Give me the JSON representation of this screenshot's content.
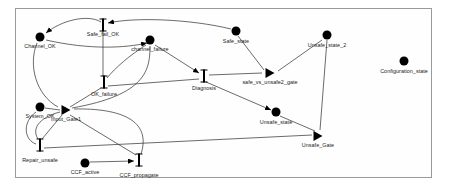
{
  "diagram": {
    "background_color": "#ffffff",
    "frame_color": "#9a9a9a",
    "ink_color": "#000000",
    "places": [
      {
        "id": "channel_ok",
        "label": "Channel_OK",
        "x": 40,
        "y": 37,
        "label_x": 40,
        "label_y": 43
      },
      {
        "id": "channel_failure",
        "label": "channel_failure",
        "x": 150,
        "y": 40,
        "label_x": 150,
        "label_y": 46
      },
      {
        "id": "safe_state",
        "label": "Safe_state",
        "x": 236,
        "y": 31,
        "label_x": 236,
        "label_y": 38
      },
      {
        "id": "unsafe_state_2",
        "label": "Unsafe_state_2",
        "x": 327,
        "y": 35,
        "label_x": 327,
        "label_y": 42
      },
      {
        "id": "configuration_state",
        "label": "Configuration_state",
        "x": 404,
        "y": 61,
        "label_x": 404,
        "label_y": 68
      },
      {
        "id": "system_ok",
        "label": "System_OK",
        "x": 40,
        "y": 107,
        "label_x": 40,
        "label_y": 113
      },
      {
        "id": "unsafe_state",
        "label": "Unsafe_state",
        "x": 276,
        "y": 112,
        "label_x": 276,
        "label_y": 119
      },
      {
        "id": "ccf_active",
        "label": "CCF_active",
        "x": 85,
        "y": 163,
        "label_x": 85,
        "label_y": 169
      }
    ],
    "activities": [
      {
        "id": "safe_fail_ok",
        "label": "Safe_fail_OK",
        "x": 103,
        "y": 25,
        "label_x": 103,
        "label_y": 31
      },
      {
        "id": "ok_failure",
        "label": "OK_failure",
        "x": 104,
        "y": 82,
        "label_x": 104,
        "label_y": 91
      },
      {
        "id": "diagnosis",
        "label": "Diagnosis",
        "x": 204,
        "y": 76,
        "label_x": 204,
        "label_y": 85
      },
      {
        "id": "repair_unsafe",
        "label": "Repair_unsafe",
        "x": 40,
        "y": 145,
        "label_x": 40,
        "label_y": 157
      },
      {
        "id": "ccf_propagate",
        "label": "CCF_propagate",
        "x": 139,
        "y": 160,
        "label_x": 139,
        "label_y": 172
      }
    ],
    "gates": [
      {
        "id": "safe_vs_unsafe2_gate",
        "label": "safe_vs_unsafe2_gate",
        "x": 270,
        "y": 73,
        "label_x": 270,
        "label_y": 79
      },
      {
        "id": "input_gate1",
        "label": "Input_Gate1",
        "x": 66,
        "y": 110,
        "label_x": 66,
        "label_y": 116
      },
      {
        "id": "unsafe_gate",
        "label": "Unsafe_Gate",
        "x": 318,
        "y": 136,
        "label_x": 318,
        "label_y": 142
      }
    ],
    "arcs": [
      {
        "from": "safe_fail_ok",
        "to": "channel_ok",
        "path": "M 101 22 C 88 14 62 20 46 33",
        "arrow": true,
        "arrow_at": "46,33",
        "arrow_angle": 140
      },
      {
        "from": "safe_state",
        "to": "safe_fail_ok",
        "path": "M 231 29 C 190 19 135 17 108 23",
        "arrow": true,
        "arrow_at": "108,23",
        "arrow_angle": 190
      },
      {
        "from": "channel_ok",
        "to": "channel_failure",
        "path": "M 46 40 C 90 50 125 48 147 43",
        "arrow": true,
        "arrow_at": "147,43",
        "arrow_angle": 345
      },
      {
        "from": "safe_fail_ok",
        "to": "ok_failure",
        "path": "M 103 32 L 103 76",
        "arrow": false
      },
      {
        "from": "channel_ok",
        "to": "input_gate1",
        "path": "M 37 43 C 28 65 36 95 58 107",
        "arrow": false
      },
      {
        "from": "channel_failure",
        "to": "diagnosis",
        "path": "M 155 45 L 199 73",
        "arrow": true,
        "arrow_at": "199,73",
        "arrow_angle": 33
      },
      {
        "from": "channel_failure",
        "to": "ok_failure",
        "path": "M 146 45 C 130 55 115 68 107 78",
        "arrow": false
      },
      {
        "from": "channel_failure",
        "to": "input_gate1",
        "path": "M 150 46 C 150 70 146 95 72 108",
        "arrow": false
      },
      {
        "from": "safe_state",
        "to": "safe_vs_unsafe2_gate",
        "path": "M 238 36 L 264 70",
        "arrow": false
      },
      {
        "from": "safe_vs_unsafe2_gate",
        "to": "unsafe_state_2",
        "path": "M 278 71 L 322 40",
        "arrow": false
      },
      {
        "from": "diagnosis",
        "to": "safe_vs_unsafe2_gate",
        "path": "M 209 75 L 262 73",
        "arrow": false
      },
      {
        "from": "ok_failure",
        "to": "diagnosis",
        "path": "M 108 86 L 199 79",
        "arrow": false
      },
      {
        "from": "ok_failure",
        "to": "input_gate1",
        "path": "M 101 88 L 70 107",
        "arrow": false
      },
      {
        "from": "diagnosis",
        "to": "unsafe_state",
        "path": "M 206 82 L 271 110",
        "arrow": true,
        "arrow_at": "271,110",
        "arrow_angle": 24
      },
      {
        "from": "unsafe_state",
        "to": "unsafe_gate",
        "path": "M 280 116 L 315 131",
        "arrow": false
      },
      {
        "from": "unsafe_state_2",
        "to": "unsafe_gate",
        "path": "M 327 40 L 320 130",
        "arrow": false
      },
      {
        "from": "system_ok",
        "to": "input_gate1",
        "path": "M 45 108 L 60 110",
        "arrow": false
      },
      {
        "from": "input_gate1",
        "to": "system_ok",
        "path": "M 36 112 C 22 122 24 140 36 144",
        "arrow": false
      },
      {
        "from": "repair_unsafe",
        "to": "unsafe_gate",
        "path": "M 44 148 L 312 135",
        "arrow": false
      },
      {
        "from": "input_gate1",
        "to": "repair_unsafe",
        "path": "M 62 115 L 42 139",
        "arrow": false
      },
      {
        "from": "input_gate1",
        "to": "ccf_propagate",
        "path": "M 70 115 L 136 155",
        "arrow": false
      },
      {
        "from": "ccf_active",
        "to": "ccf_propagate",
        "path": "M 90 162 L 134 161",
        "arrow": true,
        "arrow_at": "134,161",
        "arrow_angle": 358
      },
      {
        "from": "ccf_propagate",
        "to": "input_gate1",
        "path": "M 141 154 C 152 120 120 108 74 109",
        "arrow": false
      },
      {
        "from": "repair_unsafe",
        "to": "input_gate1",
        "path": "M 38 139 C 30 126 44 116 60 112",
        "arrow": false
      }
    ]
  }
}
